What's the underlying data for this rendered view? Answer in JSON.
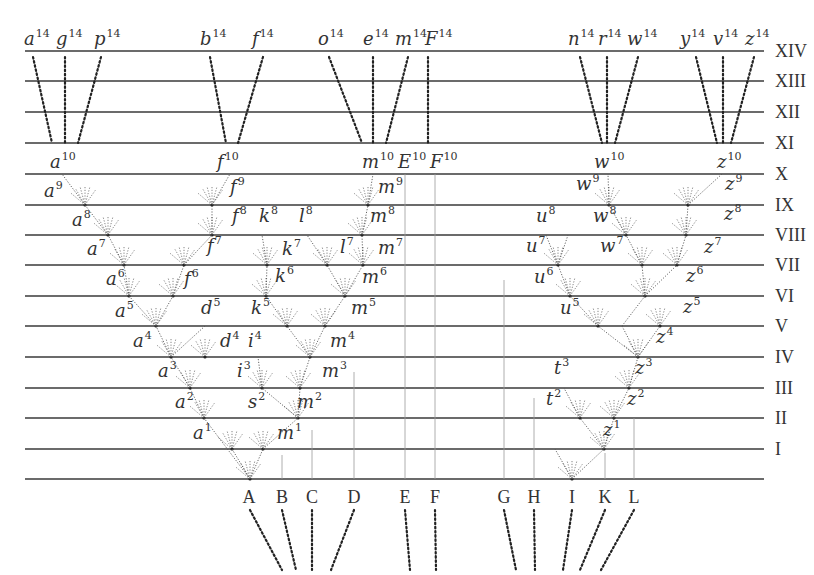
{
  "diagram": {
    "generations": [
      {
        "label": "XIV",
        "y": 51
      },
      {
        "label": "XIII",
        "y": 81
      },
      {
        "label": "XII",
        "y": 112
      },
      {
        "label": "XI",
        "y": 143
      },
      {
        "label": "X",
        "y": 174
      },
      {
        "label": "IX",
        "y": 205
      },
      {
        "label": "VIII",
        "y": 235
      },
      {
        "label": "VII",
        "y": 265
      },
      {
        "label": "VI",
        "y": 296
      },
      {
        "label": "V",
        "y": 326
      },
      {
        "label": "IV",
        "y": 357
      },
      {
        "label": "III",
        "y": 388
      },
      {
        "label": "II",
        "y": 418
      },
      {
        "label": "I",
        "y": 449
      },
      {
        "label": "",
        "y": 479
      }
    ],
    "line_x_start": 25,
    "line_x_end": 764,
    "roman_x": 775,
    "top_labels": [
      {
        "base": "a",
        "sup": "14",
        "x": 24
      },
      {
        "base": "g",
        "sup": "14",
        "x": 56
      },
      {
        "base": "p",
        "sup": "14",
        "x": 94
      },
      {
        "base": "b",
        "sup": "14",
        "x": 200
      },
      {
        "base": "f",
        "sup": "14",
        "x": 252
      },
      {
        "base": "o",
        "sup": "14",
        "x": 318
      },
      {
        "base": "e",
        "sup": "14",
        "x": 363
      },
      {
        "base": "m",
        "sup": "14",
        "x": 395
      },
      {
        "base": "F",
        "sup": "14",
        "x": 425
      },
      {
        "base": "n",
        "sup": "14",
        "x": 568
      },
      {
        "base": "r",
        "sup": "14",
        "x": 598
      },
      {
        "base": "w",
        "sup": "14",
        "x": 627
      },
      {
        "base": "y",
        "sup": "14",
        "x": 680
      },
      {
        "base": "v",
        "sup": "14",
        "x": 713
      },
      {
        "base": "z",
        "sup": "14",
        "x": 745
      }
    ],
    "gen10_labels": [
      {
        "base": "a",
        "sup": "10",
        "x": 50
      },
      {
        "base": "f",
        "sup": "10",
        "x": 217
      },
      {
        "base": "m",
        "sup": "10",
        "x": 362
      },
      {
        "base": "E",
        "sup": "10",
        "x": 398
      },
      {
        "base": "F",
        "sup": "10",
        "x": 430
      },
      {
        "base": "w",
        "sup": "10",
        "x": 594
      },
      {
        "base": "z",
        "sup": "10",
        "x": 717
      }
    ],
    "node_labels": [
      {
        "base": "a",
        "sup": "9",
        "x": 44,
        "y": 197
      },
      {
        "base": "f",
        "sup": "9",
        "x": 230,
        "y": 193
      },
      {
        "base": "m",
        "sup": "9",
        "x": 378,
        "y": 193
      },
      {
        "base": "w",
        "sup": "9",
        "x": 576,
        "y": 190
      },
      {
        "base": "z",
        "sup": "9",
        "x": 725,
        "y": 190
      },
      {
        "base": "a",
        "sup": "8",
        "x": 72,
        "y": 226
      },
      {
        "base": "f",
        "sup": "8",
        "x": 232,
        "y": 222
      },
      {
        "base": "k",
        "sup": "8",
        "x": 259,
        "y": 222
      },
      {
        "base": "l",
        "sup": "8",
        "x": 299,
        "y": 222
      },
      {
        "base": "m",
        "sup": "8",
        "x": 370,
        "y": 222
      },
      {
        "base": "u",
        "sup": "8",
        "x": 536,
        "y": 222
      },
      {
        "base": "w",
        "sup": "8",
        "x": 593,
        "y": 222
      },
      {
        "base": "z",
        "sup": "8",
        "x": 724,
        "y": 220
      },
      {
        "base": "a",
        "sup": "7",
        "x": 87,
        "y": 255
      },
      {
        "base": "f",
        "sup": "7",
        "x": 207,
        "y": 252
      },
      {
        "base": "k",
        "sup": "7",
        "x": 282,
        "y": 255
      },
      {
        "base": "l",
        "sup": "7",
        "x": 340,
        "y": 253
      },
      {
        "base": "m",
        "sup": "7",
        "x": 378,
        "y": 254
      },
      {
        "base": "u",
        "sup": "7",
        "x": 526,
        "y": 252
      },
      {
        "base": "w",
        "sup": "7",
        "x": 600,
        "y": 252
      },
      {
        "base": "z",
        "sup": "7",
        "x": 704,
        "y": 253
      },
      {
        "base": "a",
        "sup": "6",
        "x": 106,
        "y": 285
      },
      {
        "base": "f",
        "sup": "6",
        "x": 184,
        "y": 285
      },
      {
        "base": "k",
        "sup": "6",
        "x": 275,
        "y": 282
      },
      {
        "base": "m",
        "sup": "6",
        "x": 362,
        "y": 283
      },
      {
        "base": "u",
        "sup": "6",
        "x": 534,
        "y": 283
      },
      {
        "base": "z",
        "sup": "6",
        "x": 686,
        "y": 282
      },
      {
        "base": "a",
        "sup": "5",
        "x": 115,
        "y": 317
      },
      {
        "base": "d",
        "sup": "5",
        "x": 201,
        "y": 314
      },
      {
        "base": "k",
        "sup": "5",
        "x": 251,
        "y": 314
      },
      {
        "base": "m",
        "sup": "5",
        "x": 351,
        "y": 314
      },
      {
        "base": "u",
        "sup": "5",
        "x": 560,
        "y": 314
      },
      {
        "base": "z",
        "sup": "5",
        "x": 683,
        "y": 313
      },
      {
        "base": "a",
        "sup": "4",
        "x": 133,
        "y": 347
      },
      {
        "base": "d",
        "sup": "4",
        "x": 220,
        "y": 347
      },
      {
        "base": "i",
        "sup": "4",
        "x": 248,
        "y": 347
      },
      {
        "base": "m",
        "sup": "4",
        "x": 330,
        "y": 347
      },
      {
        "base": "z",
        "sup": "4",
        "x": 656,
        "y": 343
      },
      {
        "base": "a",
        "sup": "3",
        "x": 158,
        "y": 377
      },
      {
        "base": "i",
        "sup": "3",
        "x": 237,
        "y": 377
      },
      {
        "base": "m",
        "sup": "3",
        "x": 322,
        "y": 377
      },
      {
        "base": "t",
        "sup": "3",
        "x": 554,
        "y": 374
      },
      {
        "base": "z",
        "sup": "3",
        "x": 635,
        "y": 374
      },
      {
        "base": "a",
        "sup": "2",
        "x": 175,
        "y": 408
      },
      {
        "base": "s",
        "sup": "2",
        "x": 248,
        "y": 408
      },
      {
        "base": "m",
        "sup": "2",
        "x": 297,
        "y": 408
      },
      {
        "base": "t",
        "sup": "2",
        "x": 546,
        "y": 405
      },
      {
        "base": "z",
        "sup": "2",
        "x": 627,
        "y": 405
      },
      {
        "base": "a",
        "sup": "1",
        "x": 193,
        "y": 439
      },
      {
        "base": "m",
        "sup": "1",
        "x": 277,
        "y": 439
      },
      {
        "base": "z",
        "sup": "1",
        "x": 603,
        "y": 436
      }
    ],
    "ancestral_species": [
      {
        "label": "A",
        "x": 249
      },
      {
        "label": "B",
        "x": 282
      },
      {
        "label": "C",
        "x": 312
      },
      {
        "label": "D",
        "x": 354
      },
      {
        "label": "E",
        "x": 405
      },
      {
        "label": "F",
        "x": 435
      },
      {
        "label": "G",
        "x": 504
      },
      {
        "label": "H",
        "x": 534
      },
      {
        "label": "I",
        "x": 572
      },
      {
        "label": "K",
        "x": 605
      },
      {
        "label": "L",
        "x": 634
      }
    ],
    "ancestral_label_y": 497,
    "dotted_connectors": [
      [
        33,
        57,
        52,
        143
      ],
      [
        65,
        57,
        65,
        143
      ],
      [
        101,
        57,
        78,
        143
      ],
      [
        210,
        57,
        226,
        143
      ],
      [
        263,
        57,
        238,
        143
      ],
      [
        329,
        57,
        362,
        143
      ],
      [
        373,
        57,
        373,
        143
      ],
      [
        408,
        57,
        386,
        143
      ],
      [
        428,
        57,
        428,
        143
      ],
      [
        580,
        57,
        602,
        143
      ],
      [
        607,
        57,
        607,
        143
      ],
      [
        638,
        57,
        615,
        143
      ],
      [
        696,
        57,
        717,
        143
      ],
      [
        723,
        57,
        723,
        143
      ],
      [
        754,
        57,
        731,
        143
      ],
      [
        250,
        510,
        282,
        570
      ],
      [
        282,
        510,
        296,
        570
      ],
      [
        312,
        510,
        312,
        570
      ],
      [
        354,
        510,
        331,
        570
      ],
      [
        405,
        510,
        410,
        570
      ],
      [
        435,
        510,
        436,
        570
      ],
      [
        504,
        510,
        516,
        570
      ],
      [
        534,
        510,
        535,
        570
      ],
      [
        572,
        510,
        563,
        570
      ],
      [
        605,
        510,
        580,
        570
      ],
      [
        634,
        510,
        601,
        570
      ]
    ],
    "tree_branches": [
      [
        250,
        479,
        204,
        418
      ],
      [
        204,
        418,
        190,
        388
      ],
      [
        190,
        388,
        171,
        357
      ],
      [
        171,
        357,
        156,
        326
      ],
      [
        156,
        326,
        129,
        296
      ],
      [
        129,
        296,
        124,
        265
      ],
      [
        124,
        265,
        108,
        235
      ],
      [
        108,
        235,
        85,
        205
      ],
      [
        85,
        205,
        62,
        174
      ],
      [
        156,
        326,
        173,
        296
      ],
      [
        173,
        296,
        184,
        265
      ],
      [
        184,
        265,
        212,
        235
      ],
      [
        212,
        235,
        212,
        205
      ],
      [
        212,
        205,
        230,
        174
      ],
      [
        171,
        357,
        205,
        326
      ],
      [
        250,
        479,
        263,
        449
      ],
      [
        263,
        449,
        298,
        418
      ],
      [
        298,
        418,
        300,
        388
      ],
      [
        300,
        388,
        310,
        357
      ],
      [
        310,
        357,
        287,
        326
      ],
      [
        287,
        326,
        266,
        296
      ],
      [
        266,
        296,
        267,
        265
      ],
      [
        267,
        265,
        262,
        235
      ],
      [
        310,
        357,
        325,
        326
      ],
      [
        325,
        326,
        345,
        296
      ],
      [
        345,
        296,
        363,
        265
      ],
      [
        363,
        265,
        362,
        235
      ],
      [
        362,
        235,
        368,
        205
      ],
      [
        368,
        205,
        373,
        174
      ],
      [
        345,
        296,
        327,
        265
      ],
      [
        327,
        265,
        307,
        235
      ],
      [
        298,
        418,
        262,
        388
      ],
      [
        262,
        388,
        258,
        357
      ],
      [
        250,
        479,
        232,
        449
      ],
      [
        572,
        479,
        604,
        449
      ],
      [
        604,
        449,
        614,
        418
      ],
      [
        614,
        418,
        629,
        388
      ],
      [
        629,
        388,
        638,
        357
      ],
      [
        638,
        357,
        622,
        326
      ],
      [
        622,
        326,
        645,
        296
      ],
      [
        645,
        296,
        677,
        265
      ],
      [
        677,
        265,
        686,
        235
      ],
      [
        686,
        235,
        688,
        205
      ],
      [
        688,
        205,
        722,
        174
      ],
      [
        645,
        296,
        642,
        265
      ],
      [
        642,
        265,
        626,
        235
      ],
      [
        626,
        235,
        609,
        205
      ],
      [
        609,
        205,
        608,
        174
      ],
      [
        638,
        357,
        598,
        326
      ],
      [
        598,
        326,
        570,
        296
      ],
      [
        570,
        296,
        558,
        265
      ],
      [
        558,
        265,
        546,
        235
      ],
      [
        558,
        265,
        568,
        235
      ],
      [
        638,
        357,
        660,
        326
      ],
      [
        604,
        449,
        580,
        418
      ],
      [
        580,
        418,
        564,
        388
      ],
      [
        572,
        479,
        555,
        449
      ]
    ],
    "fan_nodes": [
      [
        85,
        205
      ],
      [
        108,
        235
      ],
      [
        124,
        265
      ],
      [
        129,
        296
      ],
      [
        156,
        326
      ],
      [
        171,
        357
      ],
      [
        190,
        388
      ],
      [
        204,
        418
      ],
      [
        232,
        449
      ],
      [
        250,
        479
      ],
      [
        212,
        205
      ],
      [
        212,
        235
      ],
      [
        184,
        265
      ],
      [
        173,
        296
      ],
      [
        205,
        357
      ],
      [
        263,
        449
      ],
      [
        298,
        418
      ],
      [
        262,
        388
      ],
      [
        300,
        388
      ],
      [
        310,
        357
      ],
      [
        287,
        326
      ],
      [
        325,
        326
      ],
      [
        266,
        296
      ],
      [
        345,
        296
      ],
      [
        267,
        265
      ],
      [
        327,
        265
      ],
      [
        363,
        265
      ],
      [
        362,
        235
      ],
      [
        368,
        205
      ],
      [
        609,
        205
      ],
      [
        626,
        235
      ],
      [
        642,
        265
      ],
      [
        645,
        296
      ],
      [
        677,
        265
      ],
      [
        686,
        235
      ],
      [
        688,
        205
      ],
      [
        558,
        265
      ],
      [
        570,
        296
      ],
      [
        598,
        326
      ],
      [
        660,
        326
      ],
      [
        638,
        357
      ],
      [
        629,
        388
      ],
      [
        614,
        418
      ],
      [
        580,
        418
      ],
      [
        604,
        449
      ],
      [
        572,
        479
      ]
    ],
    "thin_verticals": [
      [
        405,
        174,
        405,
        479
      ],
      [
        435,
        174,
        435,
        479
      ],
      [
        504,
        280,
        504,
        479
      ],
      [
        534,
        398,
        534,
        479
      ],
      [
        605,
        453,
        605,
        479
      ],
      [
        634,
        418,
        634,
        479
      ],
      [
        354,
        372,
        354,
        479
      ],
      [
        312,
        430,
        312,
        479
      ],
      [
        282,
        455,
        282,
        479
      ]
    ]
  }
}
